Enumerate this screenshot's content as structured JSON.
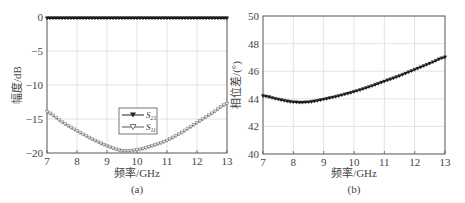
{
  "chart_data": [
    {
      "panel": "(a)",
      "type": "line",
      "title": "",
      "xlabel": "频率/GHz",
      "ylabel": "幅度/dB",
      "xlim": [
        7,
        13
      ],
      "ylim": [
        -20,
        0
      ],
      "xticks": [
        7,
        8,
        9,
        10,
        11,
        12,
        13
      ],
      "yticks": [
        0,
        -5,
        -10,
        -15,
        -20
      ],
      "grid": true,
      "legend_position": "center",
      "series": [
        {
          "name": "S21",
          "marker": "filled-triangle",
          "x": [
            7,
            7.5,
            8,
            8.5,
            9,
            9.5,
            10,
            10.5,
            11,
            11.5,
            12,
            12.5,
            13
          ],
          "values": [
            -0.2,
            -0.2,
            -0.2,
            -0.2,
            -0.2,
            -0.2,
            -0.2,
            -0.2,
            -0.2,
            -0.2,
            -0.2,
            -0.2,
            -0.2
          ]
        },
        {
          "name": "S11",
          "marker": "hollow-triangle",
          "x": [
            7,
            7.5,
            8,
            8.5,
            9,
            9.5,
            10,
            10.5,
            11,
            11.5,
            12,
            12.5,
            13
          ],
          "values": [
            -14.0,
            -15.5,
            -16.8,
            -18.0,
            -19.0,
            -19.7,
            -19.6,
            -19.0,
            -18.2,
            -17.0,
            -15.6,
            -14.2,
            -12.8
          ]
        }
      ]
    },
    {
      "panel": "(b)",
      "type": "line",
      "title": "",
      "xlabel": "频率/GHz",
      "ylabel": "相位差/(°)",
      "xlim": [
        7,
        13
      ],
      "ylim": [
        40,
        50
      ],
      "xticks": [
        7,
        8,
        9,
        10,
        11,
        12,
        13
      ],
      "yticks": [
        40,
        42,
        44,
        46,
        48,
        50
      ],
      "grid": true,
      "series": [
        {
          "name": "phase difference",
          "marker": "filled-triangle",
          "x": [
            7,
            7.5,
            8,
            8.5,
            9,
            9.5,
            10,
            10.5,
            11,
            11.5,
            12,
            12.5,
            13
          ],
          "values": [
            44.2,
            43.95,
            43.75,
            43.75,
            43.95,
            44.2,
            44.5,
            44.85,
            45.25,
            45.65,
            46.1,
            46.55,
            47.0
          ]
        }
      ]
    }
  ],
  "panels": {
    "a": {
      "xlabel": "频率/GHz",
      "ylabel": "幅度/dB",
      "caption": "(a)",
      "legend": [
        "S21",
        "S11"
      ],
      "xticks": [
        "7",
        "8",
        "9",
        "10",
        "11",
        "12",
        "13"
      ],
      "yticks": [
        "0",
        "-5",
        "-10",
        "-15",
        "-20"
      ]
    },
    "b": {
      "xlabel": "频率/GHz",
      "ylabel": "相位差/(°)",
      "caption": "(b)",
      "xticks": [
        "7",
        "8",
        "9",
        "10",
        "11",
        "12",
        "13"
      ],
      "yticks": [
        "50",
        "48",
        "46",
        "44",
        "42",
        "40"
      ]
    }
  }
}
